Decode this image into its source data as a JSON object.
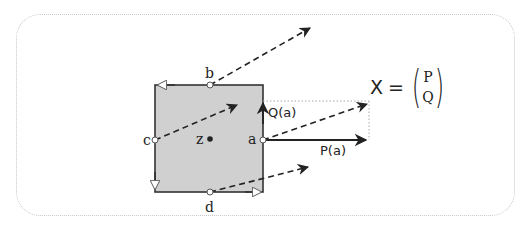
{
  "diagram": {
    "type": "vector-field-cell",
    "colors": {
      "cell_fill": "#d0d0d0",
      "cell_stroke": "#333333",
      "arrow": "#222222",
      "dotted_guide": "#aaaaaa",
      "frame": "#c8c8c8"
    },
    "cell": {
      "center_label": "z",
      "points": {
        "a": "a",
        "b": "b",
        "c": "c",
        "d": "d"
      }
    },
    "components": {
      "q_label": "Q(a)",
      "p_label": "P(a)"
    },
    "formula": {
      "lhs": "X",
      "equals": "=",
      "open_paren": "(",
      "close_paren": ")",
      "top": "P",
      "bottom": "Q"
    }
  }
}
